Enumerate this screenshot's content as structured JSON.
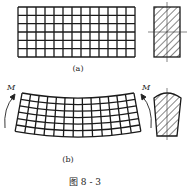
{
  "figure": {
    "caption": "图 8 - 3",
    "panel_a": {
      "label": "(a)",
      "grid": {
        "columns": 13,
        "rows": 6
      },
      "cross_section": "rectangle-hatched"
    },
    "panel_b": {
      "label": "(b)",
      "moment_left": "M",
      "moment_right": "M",
      "grid": {
        "columns": 13,
        "rows": 6
      },
      "cross_section": "trapezoid-hatched"
    }
  }
}
